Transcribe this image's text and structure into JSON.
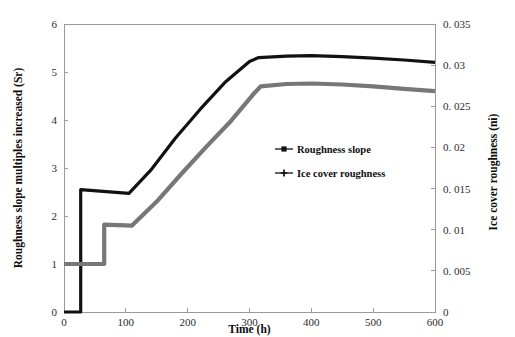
{
  "chart_data": {
    "type": "line",
    "title": "",
    "xlabel": "Time (h)",
    "ylabel": "Roughness slope multiples increased (Sr)",
    "y2label": "Ice cover roughness (ni)",
    "xlim": [
      0,
      600
    ],
    "ylim": [
      0,
      6
    ],
    "y2lim": [
      0,
      0.035
    ],
    "grid": false,
    "legend_position": "center",
    "x_ticks": [
      "0",
      "100",
      "200",
      "300",
      "400",
      "500",
      "600"
    ],
    "x_tick_values": [
      0,
      100,
      200,
      300,
      400,
      500,
      600
    ],
    "y_ticks": [
      "0",
      "1",
      "2",
      "3",
      "4",
      "5",
      "6"
    ],
    "y_tick_values": [
      0,
      1,
      2,
      3,
      4,
      5,
      6
    ],
    "y2_ticks": [
      "0",
      "0. 005",
      "0. 01",
      "0. 015",
      "0. 02",
      "0. 025",
      "0. 03",
      "0. 035"
    ],
    "y2_tick_values": [
      0,
      0.005,
      0.01,
      0.015,
      0.02,
      0.025,
      0.03,
      0.035
    ],
    "series": [
      {
        "name": "Roughness slope",
        "axis": "right",
        "color": "#111111",
        "marker": "square",
        "stroke_width": 3.2,
        "points": [
          [
            0,
            0.0
          ],
          [
            27,
            0.0
          ],
          [
            27,
            2.55
          ],
          [
            105,
            2.47
          ],
          [
            140,
            2.95
          ],
          [
            180,
            3.62
          ],
          [
            220,
            4.22
          ],
          [
            260,
            4.78
          ],
          [
            300,
            5.22
          ],
          [
            315,
            5.3
          ],
          [
            360,
            5.33
          ],
          [
            400,
            5.34
          ],
          [
            450,
            5.32
          ],
          [
            500,
            5.29
          ],
          [
            550,
            5.25
          ],
          [
            600,
            5.2
          ]
        ]
      },
      {
        "name": "Ice cover roughness",
        "axis": "right",
        "color": "#777777",
        "marker": "plus",
        "stroke_width": 4.2,
        "points": [
          [
            0,
            1.0
          ],
          [
            65,
            1.0
          ],
          [
            65,
            1.82
          ],
          [
            110,
            1.8
          ],
          [
            150,
            2.3
          ],
          [
            190,
            2.88
          ],
          [
            230,
            3.44
          ],
          [
            270,
            3.98
          ],
          [
            305,
            4.52
          ],
          [
            318,
            4.7
          ],
          [
            360,
            4.75
          ],
          [
            400,
            4.76
          ],
          [
            450,
            4.74
          ],
          [
            500,
            4.7
          ],
          [
            550,
            4.65
          ],
          [
            600,
            4.6
          ]
        ]
      }
    ],
    "legend": [
      {
        "label": "Roughness slope",
        "color": "#111111",
        "marker": "square"
      },
      {
        "label": "Ice cover roughness",
        "color": "#111111",
        "marker": "plus"
      }
    ]
  },
  "plot_geometry": {
    "left": 64,
    "right": 435,
    "top": 24,
    "bottom": 312
  }
}
